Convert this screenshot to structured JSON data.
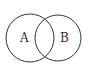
{
  "diagram": {
    "type": "venn",
    "sets": [
      {
        "label": "A",
        "cx": 30,
        "cy": 38,
        "r": 24
      },
      {
        "label": "B",
        "cx": 58,
        "cy": 38,
        "r": 23
      }
    ],
    "stroke_color": "#333333"
  }
}
